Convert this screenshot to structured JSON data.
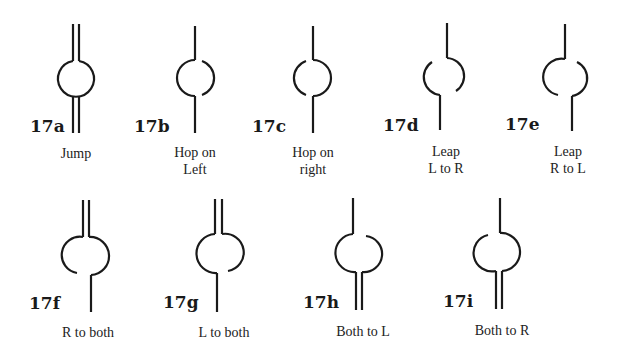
{
  "figure": {
    "items": [
      {
        "id": "17a",
        "caption_lines": [
          "Jump"
        ],
        "top": "both",
        "bottom": "both",
        "gap": "none"
      },
      {
        "id": "17b",
        "caption_lines": [
          "Hop on",
          "Left"
        ],
        "top": "left",
        "bottom": "left",
        "gap": "right-arc-open"
      },
      {
        "id": "17c",
        "caption_lines": [
          "Hop on",
          "right"
        ],
        "top": "right",
        "bottom": "right",
        "gap": "left-arc-open"
      },
      {
        "id": "17d",
        "caption_lines": [
          "Leap",
          "L to R"
        ],
        "top": "right",
        "bottom": "left",
        "gap": "top-left and bottom-right open"
      },
      {
        "id": "17e",
        "caption_lines": [
          "Leap",
          "R to L"
        ],
        "top": "left",
        "bottom": "right",
        "gap": "top-right and bottom-left open"
      },
      {
        "id": "17f",
        "caption_lines": [
          "R to both"
        ],
        "top": "both",
        "bottom": "right",
        "gap": "bottom-left open"
      },
      {
        "id": "17g",
        "caption_lines": [
          "L to both"
        ],
        "top": "both",
        "bottom": "left",
        "gap": "bottom-right open"
      },
      {
        "id": "17h",
        "caption_lines": [
          "Both to L"
        ],
        "top": "left",
        "bottom": "both",
        "gap": "top-right open"
      },
      {
        "id": "17i",
        "caption_lines": [
          "Both to R"
        ],
        "top": "right",
        "bottom": "both",
        "gap": "top-left open"
      }
    ]
  },
  "colors": {
    "ink": "#1a1a1a",
    "background": "#ffffff"
  }
}
